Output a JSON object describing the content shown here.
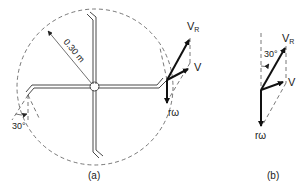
{
  "figure": {
    "panel_a": {
      "caption": "(a)",
      "radius_label": "0.30 m",
      "angle_label": "30°",
      "vectors": {
        "resultant": "V",
        "resultant_sub": "R",
        "relative": "V",
        "tangential": "rω"
      }
    },
    "panel_b": {
      "caption": "(b)",
      "angle_label": "30°",
      "vectors": {
        "resultant": "V",
        "resultant_sub": "R",
        "relative": "V",
        "tangential": "rω"
      }
    }
  },
  "colors": {
    "line": "#111111",
    "dashed": "#555555",
    "background": "#ffffff"
  }
}
